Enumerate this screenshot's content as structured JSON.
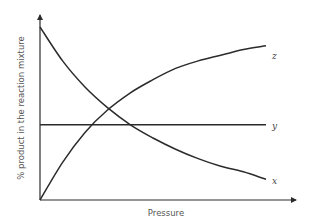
{
  "chart_data": {
    "type": "line",
    "title": "",
    "xlabel": "Pressure",
    "ylabel": "% product in the reaction mixture",
    "xlim": [
      0,
      1
    ],
    "ylim": [
      0,
      1
    ],
    "grid": false,
    "legend": "inline labels at line ends",
    "ticks": {
      "x": [],
      "y": []
    },
    "series": [
      {
        "name": "x",
        "trend": "decreasing, convex",
        "x": [
          0,
          0.1,
          0.2,
          0.3,
          0.4,
          0.5,
          0.6,
          0.7,
          0.8,
          0.9,
          1.0
        ],
        "values": [
          0.92,
          0.74,
          0.6,
          0.49,
          0.4,
          0.33,
          0.27,
          0.22,
          0.18,
          0.15,
          0.11
        ]
      },
      {
        "name": "y",
        "trend": "constant",
        "x": [
          0,
          1.0
        ],
        "values": [
          0.4,
          0.4
        ]
      },
      {
        "name": "z",
        "trend": "increasing, concave",
        "x": [
          0,
          0.1,
          0.2,
          0.3,
          0.4,
          0.5,
          0.6,
          0.7,
          0.8,
          0.9,
          1.0
        ],
        "values": [
          0.0,
          0.2,
          0.36,
          0.48,
          0.57,
          0.64,
          0.7,
          0.74,
          0.77,
          0.8,
          0.82
        ]
      }
    ]
  },
  "labels": {
    "x_axis": "Pressure",
    "y_axis": "% product in the reaction mixture",
    "series_x": "x",
    "series_y": "y",
    "series_z": "z"
  }
}
